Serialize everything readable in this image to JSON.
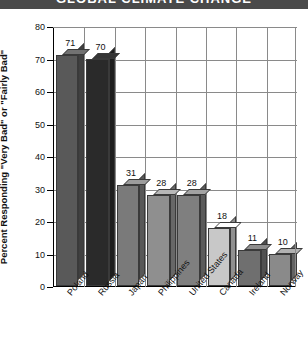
{
  "title": "GLOBAL CLIMATE CHANGE",
  "chart_data": {
    "type": "bar",
    "title": "GLOBAL CLIMATE CHANGE",
    "xlabel": "",
    "ylabel": "Percent Responding \"Very Bad\" or \"Fairly Bad\"",
    "categories": [
      "Poland",
      "Russia",
      "Japan",
      "Philippines",
      "United States",
      "Canada",
      "Ireland",
      "Norway"
    ],
    "values": [
      71,
      70,
      31,
      28,
      28,
      18,
      11,
      10
    ],
    "bar_colors": [
      "#595959",
      "#2a2a2a",
      "#7a7a7a",
      "#8f8f8f",
      "#7f7f7f",
      "#c8c8c8",
      "#6f6f6f",
      "#8a8a8a"
    ],
    "ylim": [
      0,
      80
    ],
    "ytick_values": [
      0,
      10,
      20,
      30,
      40,
      50,
      60,
      70,
      80
    ],
    "ytick_labels": [
      "0",
      "10",
      "20",
      "30",
      "40",
      "50",
      "60",
      "70",
      "80"
    ],
    "grid": true,
    "legend": "none",
    "style": "3d-bars"
  }
}
